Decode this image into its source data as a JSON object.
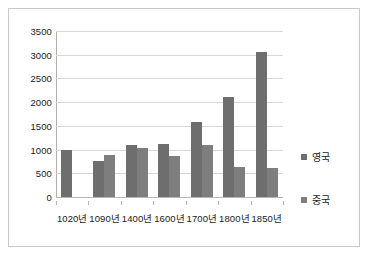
{
  "chart_data": {
    "type": "bar",
    "title": "",
    "subtitle": "",
    "xlabel": "",
    "ylabel": "",
    "grid": true,
    "legend_position": "right",
    "ylim": [
      0,
      3500
    ],
    "ytick_step": 500,
    "ytick_labels": [
      "3500",
      "3000",
      "2500",
      "2000",
      "1500",
      "1000",
      "500",
      "0"
    ],
    "ytick_values": [
      3500,
      3000,
      2500,
      2000,
      1500,
      1000,
      500,
      0
    ],
    "categories": [
      "1020년",
      "1090년",
      "1400년",
      "1600년",
      "1700년",
      "1800년",
      "1850년"
    ],
    "series": [
      {
        "name": "영국",
        "color": "#6e6e6e",
        "values": [
          1000,
          760,
          1090,
          1110,
          1580,
          2100,
          3050
        ]
      },
      {
        "name": "중국",
        "color": "#7e7e7e",
        "values": [
          null,
          880,
          1030,
          870,
          1100,
          630,
          620
        ]
      }
    ],
    "legend": [
      {
        "label": "영국",
        "color": "#6e6e6e"
      },
      {
        "label": "중국",
        "color": "#7e7e7e"
      }
    ]
  }
}
